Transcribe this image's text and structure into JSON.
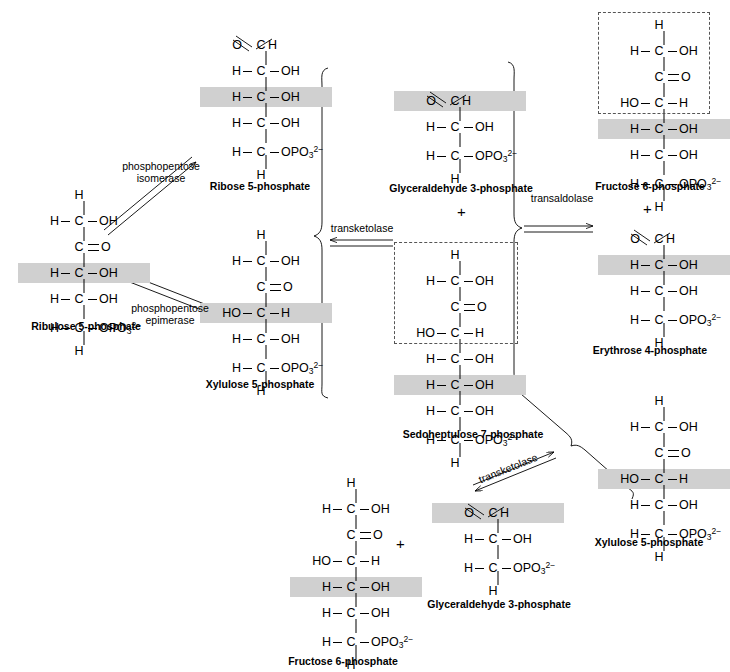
{
  "diagram": {
    "symbols": {
      "plus": "+",
      "double_bond": "=",
      "charge": "2-",
      "phosphate": "OPO",
      "phosphate_sub": "3"
    }
  },
  "enzymes": [
    {
      "id": "phosphopentose-isomerase",
      "line1": "phosphopentose",
      "line2": "isomerase"
    },
    {
      "id": "phosphopentose-epimerase",
      "line1": "phosphopentose",
      "line2": "epimerase"
    },
    {
      "id": "transketolase-1",
      "line1": "transketolase",
      "line2": ""
    },
    {
      "id": "transaldolase",
      "line1": "transaldolase",
      "line2": ""
    },
    {
      "id": "transketolase-2",
      "line1": "transketolase",
      "line2": ""
    }
  ],
  "plus_signs": [
    {
      "id": "plus-g3p-s7p",
      "label": "+"
    },
    {
      "id": "plus-f6p-e4p",
      "label": "+"
    },
    {
      "id": "plus-f6p-g3p",
      "label": "+"
    }
  ],
  "molecules": [
    {
      "id": "ribulose-5-phosphate",
      "caption": "Ribulose 5-phosphate",
      "rows": [
        {
          "left": "",
          "center": "H",
          "right": ""
        },
        {
          "left": "H",
          "center": "C",
          "right": "OH",
          "bond_left": "single",
          "bond_right": "single"
        },
        {
          "left": "",
          "center": "C",
          "right": "O",
          "bond_right": "double"
        },
        {
          "left": "H",
          "center": "C",
          "right": "OH",
          "bond_left": "single",
          "bond_right": "single",
          "highlight": true
        },
        {
          "left": "H",
          "center": "C",
          "right": "OH",
          "bond_left": "single",
          "bond_right": "single"
        },
        {
          "left": "H",
          "center": "C",
          "right": "OPO3^2-",
          "bond_left": "single",
          "bond_right": "single"
        },
        {
          "left": "",
          "center": "H",
          "right": ""
        }
      ]
    },
    {
      "id": "ribose-5-phosphate",
      "caption": "Ribose 5-phosphate",
      "rows": [
        {
          "left": "O",
          "center": "C",
          "right": "H",
          "bond_left": "aldehyde"
        },
        {
          "left": "H",
          "center": "C",
          "right": "OH",
          "bond_left": "single",
          "bond_right": "single"
        },
        {
          "left": "H",
          "center": "C",
          "right": "OH",
          "bond_left": "single",
          "bond_right": "single",
          "highlight": true
        },
        {
          "left": "H",
          "center": "C",
          "right": "OH",
          "bond_left": "single",
          "bond_right": "single"
        },
        {
          "left": "H",
          "center": "C",
          "right": "OPO3^2-",
          "bond_left": "single",
          "bond_right": "single"
        },
        {
          "left": "",
          "center": "H",
          "right": ""
        }
      ]
    },
    {
      "id": "xylulose-5-phosphate-left",
      "caption": "Xylulose 5-phosphate",
      "rows": [
        {
          "left": "",
          "center": "H",
          "right": ""
        },
        {
          "left": "H",
          "center": "C",
          "right": "OH",
          "bond_left": "single",
          "bond_right": "single"
        },
        {
          "left": "",
          "center": "C",
          "right": "O",
          "bond_right": "double"
        },
        {
          "left": "HO",
          "center": "C",
          "right": "H",
          "bond_left": "single",
          "bond_right": "single",
          "highlight": true
        },
        {
          "left": "H",
          "center": "C",
          "right": "OH",
          "bond_left": "single",
          "bond_right": "single"
        },
        {
          "left": "H",
          "center": "C",
          "right": "OPO3^2-",
          "bond_left": "single",
          "bond_right": "single"
        },
        {
          "left": "",
          "center": "H",
          "right": ""
        }
      ]
    },
    {
      "id": "glyceraldehyde-3-phosphate-top",
      "caption": "Glyceraldehyde 3-phosphate",
      "rows": [
        {
          "left": "O",
          "center": "C",
          "right": "H",
          "bond_left": "aldehyde",
          "highlight": true
        },
        {
          "left": "H",
          "center": "C",
          "right": "OH",
          "bond_left": "single",
          "bond_right": "single"
        },
        {
          "left": "H",
          "center": "C",
          "right": "OPO3^2-",
          "bond_left": "single",
          "bond_right": "single"
        },
        {
          "left": "",
          "center": "H",
          "right": ""
        }
      ]
    },
    {
      "id": "sedoheptulose-7-phosphate",
      "caption": "Sedoheptulose 7-phosphate",
      "dashed_rows": 4,
      "rows": [
        {
          "left": "",
          "center": "H",
          "right": ""
        },
        {
          "left": "H",
          "center": "C",
          "right": "OH",
          "bond_left": "single",
          "bond_right": "single"
        },
        {
          "left": "",
          "center": "C",
          "right": "O",
          "bond_right": "double"
        },
        {
          "left": "HO",
          "center": "C",
          "right": "H",
          "bond_left": "single",
          "bond_right": "single"
        },
        {
          "left": "H",
          "center": "C",
          "right": "OH",
          "bond_left": "single",
          "bond_right": "single"
        },
        {
          "left": "H",
          "center": "C",
          "right": "OH",
          "bond_left": "single",
          "bond_right": "single",
          "highlight": true
        },
        {
          "left": "H",
          "center": "C",
          "right": "OH",
          "bond_left": "single",
          "bond_right": "single"
        },
        {
          "left": "H",
          "center": "C",
          "right": "OPO3^2-",
          "bond_left": "single",
          "bond_right": "single"
        },
        {
          "left": "",
          "center": "H",
          "right": ""
        }
      ]
    },
    {
      "id": "fructose-6-phosphate-top",
      "caption": "Fructose 6-phosphate",
      "dashed_rows": 4,
      "rows": [
        {
          "left": "",
          "center": "H",
          "right": ""
        },
        {
          "left": "H",
          "center": "C",
          "right": "OH",
          "bond_left": "single",
          "bond_right": "single"
        },
        {
          "left": "",
          "center": "C",
          "right": "O",
          "bond_right": "double"
        },
        {
          "left": "HO",
          "center": "C",
          "right": "H",
          "bond_left": "single",
          "bond_right": "single"
        },
        {
          "left": "H",
          "center": "C",
          "right": "OH",
          "bond_left": "single",
          "bond_right": "single",
          "highlight": true
        },
        {
          "left": "H",
          "center": "C",
          "right": "OH",
          "bond_left": "single",
          "bond_right": "single"
        },
        {
          "left": "H",
          "center": "C",
          "right": "OPO3^2-",
          "bond_left": "single",
          "bond_right": "single"
        },
        {
          "left": "",
          "center": "H",
          "right": ""
        }
      ]
    },
    {
      "id": "erythrose-4-phosphate",
      "caption": "Erythrose 4-phosphate",
      "rows": [
        {
          "left": "O",
          "center": "C",
          "right": "H",
          "bond_left": "aldehyde"
        },
        {
          "left": "H",
          "center": "C",
          "right": "OH",
          "bond_left": "single",
          "bond_right": "single",
          "highlight": true
        },
        {
          "left": "H",
          "center": "C",
          "right": "OH",
          "bond_left": "single",
          "bond_right": "single"
        },
        {
          "left": "H",
          "center": "C",
          "right": "OPO3^2-",
          "bond_left": "single",
          "bond_right": "single"
        },
        {
          "left": "",
          "center": "H",
          "right": ""
        }
      ]
    },
    {
      "id": "xylulose-5-phosphate-right",
      "caption": "Xylulose 5-phosphate",
      "rows": [
        {
          "left": "",
          "center": "H",
          "right": ""
        },
        {
          "left": "H",
          "center": "C",
          "right": "OH",
          "bond_left": "single",
          "bond_right": "single"
        },
        {
          "left": "",
          "center": "C",
          "right": "O",
          "bond_right": "double"
        },
        {
          "left": "HO",
          "center": "C",
          "right": "H",
          "bond_left": "single",
          "bond_right": "single",
          "highlight": true
        },
        {
          "left": "H",
          "center": "C",
          "right": "OH",
          "bond_left": "single",
          "bond_right": "single"
        },
        {
          "left": "H",
          "center": "C",
          "right": "OPO3^2-",
          "bond_left": "single",
          "bond_right": "single"
        },
        {
          "left": "",
          "center": "H",
          "right": ""
        }
      ]
    },
    {
      "id": "fructose-6-phosphate-bottom",
      "caption": "Fructose 6-phosphate",
      "rows": [
        {
          "left": "",
          "center": "H",
          "right": ""
        },
        {
          "left": "H",
          "center": "C",
          "right": "OH",
          "bond_left": "single",
          "bond_right": "single"
        },
        {
          "left": "",
          "center": "C",
          "right": "O",
          "bond_right": "double"
        },
        {
          "left": "HO",
          "center": "C",
          "right": "H",
          "bond_left": "single",
          "bond_right": "single"
        },
        {
          "left": "H",
          "center": "C",
          "right": "OH",
          "bond_left": "single",
          "bond_right": "single",
          "highlight": true
        },
        {
          "left": "H",
          "center": "C",
          "right": "OH",
          "bond_left": "single",
          "bond_right": "single"
        },
        {
          "left": "H",
          "center": "C",
          "right": "OPO3^2-",
          "bond_left": "single",
          "bond_right": "single"
        },
        {
          "left": "",
          "center": "H",
          "right": ""
        }
      ]
    },
    {
      "id": "glyceraldehyde-3-phosphate-bottom",
      "caption": "Glyceraldehyde 3-phosphate",
      "rows": [
        {
          "left": "O",
          "center": "C",
          "right": "H",
          "bond_left": "aldehyde",
          "highlight": true
        },
        {
          "left": "H",
          "center": "C",
          "right": "OH",
          "bond_left": "single",
          "bond_right": "single"
        },
        {
          "left": "H",
          "center": "C",
          "right": "OPO3^2-",
          "bond_left": "single",
          "bond_right": "single"
        },
        {
          "left": "",
          "center": "H",
          "right": ""
        }
      ]
    }
  ],
  "colors": {
    "highlight": "#d0d0d0",
    "stroke": "#000000",
    "dashed": "#555555",
    "background": "#ffffff"
  }
}
